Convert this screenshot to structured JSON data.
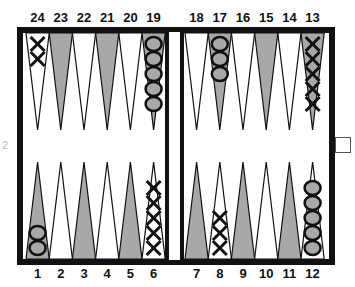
{
  "game": "backgammon",
  "colors": {
    "frame": "#111111",
    "dark_point": "#a8a8a8",
    "light_point": "#ffffff",
    "checker_o_fill": "#a8a8a8"
  },
  "top_labels": [
    "24",
    "23",
    "22",
    "21",
    "20",
    "19",
    "18",
    "17",
    "16",
    "15",
    "14",
    "13"
  ],
  "bottom_labels": [
    "1",
    "2",
    "3",
    "4",
    "5",
    "6",
    "7",
    "8",
    "9",
    "10",
    "11",
    "12"
  ],
  "faint_label": "2",
  "cube": {
    "value": ""
  },
  "points": {
    "1": {
      "player": "O",
      "count": 2
    },
    "6": {
      "player": "X",
      "count": 5
    },
    "8": {
      "player": "X",
      "count": 3
    },
    "12": {
      "player": "O",
      "count": 5
    },
    "13": {
      "player": "X",
      "count": 5
    },
    "17": {
      "player": "O",
      "count": 3
    },
    "19": {
      "player": "O",
      "count": 5
    },
    "24": {
      "player": "X",
      "count": 2
    }
  }
}
